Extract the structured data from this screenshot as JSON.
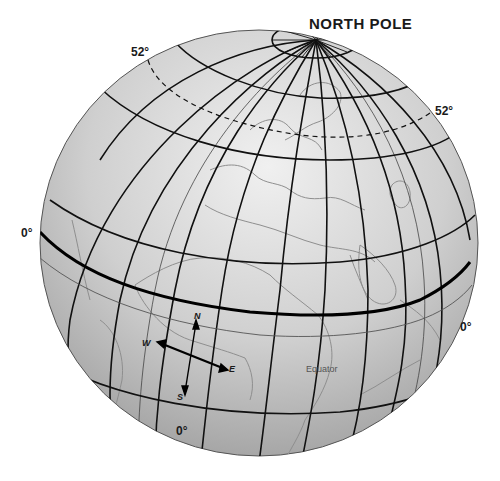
{
  "diagram": {
    "title": "NORTH POLE",
    "labels": {
      "lat52_left": "52°",
      "lat52_right": "52°",
      "equator_left": "0°",
      "equator_right": "0°",
      "meridian_bottom": "0°",
      "equator_name": "Equator"
    },
    "compass": {
      "north": "N",
      "south": "S",
      "east": "E",
      "west": "W"
    },
    "colors": {
      "globe_light": "#e6e6e6",
      "globe_dark": "#9a9a9a",
      "grid_lines": "#111111",
      "coastlines": "#8a8a8a",
      "background": "#ffffff"
    }
  }
}
